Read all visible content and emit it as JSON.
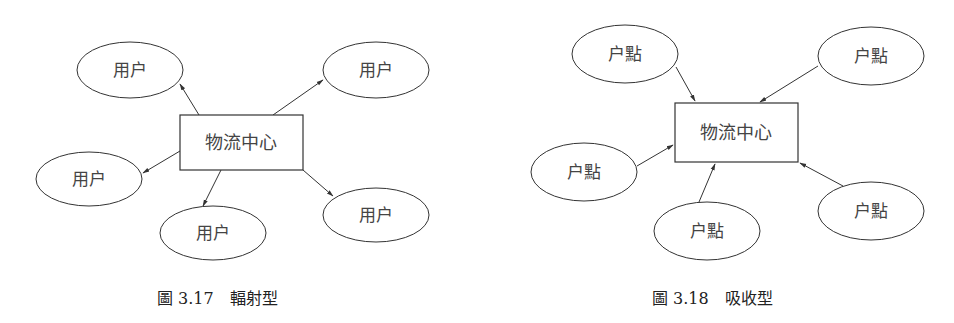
{
  "figures": [
    {
      "caption": "圖 3.17　輻射型",
      "center_label": "物流中心",
      "type": "radiation",
      "node_labels": [
        "用户",
        "用户",
        "用户",
        "用户",
        "用户"
      ],
      "arrow_direction": "outward"
    },
    {
      "caption": "圖 3.18　吸收型",
      "center_label": "物流中心",
      "type": "absorption",
      "node_labels": [
        "户點",
        "户點",
        "户點",
        "户點",
        "户點"
      ],
      "arrow_direction": "inward"
    }
  ],
  "colors": {
    "stroke": "#333333",
    "text": "#444444",
    "background": "#ffffff"
  }
}
